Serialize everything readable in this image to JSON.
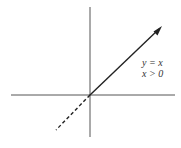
{
  "diagram": {
    "type": "graph",
    "labels": {
      "equation": "y = x",
      "condition": "x > 0"
    },
    "colors": {
      "axis": "#555555",
      "ray": "#222222",
      "background": "#ffffff"
    },
    "axes": {
      "horizontal": {
        "y": 95,
        "x_start": 11,
        "x_end": 175
      },
      "vertical": {
        "x": 90,
        "y_start": 7,
        "y_end": 137
      }
    },
    "origin": {
      "x": 90,
      "y": 95
    },
    "ray_solid": {
      "from": [
        90,
        95
      ],
      "to": [
        162,
        26
      ],
      "arrow": true
    },
    "ray_dashed": {
      "from": [
        90,
        95
      ],
      "to": [
        56,
        130
      ]
    }
  }
}
